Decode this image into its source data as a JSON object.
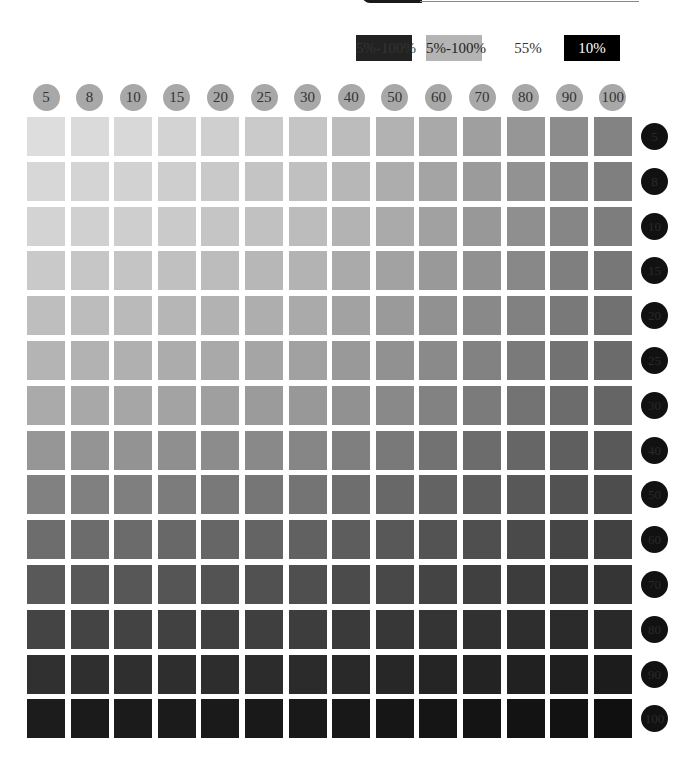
{
  "header": {
    "tab_color": "#1a1a1a"
  },
  "legend": [
    {
      "label": "5%-100%",
      "style": "dark"
    },
    {
      "label": "5%-100%",
      "style": "gray"
    },
    {
      "label": "55%",
      "style": "plain"
    },
    {
      "label": "10%",
      "style": "black"
    }
  ],
  "grid": {
    "columns": [
      "5",
      "8",
      "10",
      "15",
      "20",
      "25",
      "30",
      "40",
      "50",
      "60",
      "70",
      "80",
      "90",
      "100"
    ],
    "rows": [
      "5",
      "8",
      "10",
      "15",
      "20",
      "25",
      "30",
      "40",
      "50",
      "60",
      "70",
      "80",
      "90",
      "100"
    ],
    "top_left_color": "#e6e6e6",
    "top_right_color": "#8a8a8a",
    "bottom_left_color": "#141414",
    "bottom_right_color": "#000000",
    "column_label_bg": "#a8a8a8",
    "row_label_bg": "#111111"
  }
}
